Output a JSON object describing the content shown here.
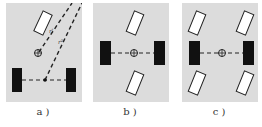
{
  "figure": {
    "panels": [
      {
        "id": "a",
        "caption": "a )",
        "description": "Front-wheel steering: two front wheels turned, instantaneous center on rear axle line",
        "labels": [
          "r'",
          "r²"
        ]
      },
      {
        "id": "b",
        "caption": "b )",
        "description": "Front and rear wheel steering, center wheels fixed, turning about center"
      },
      {
        "id": "c",
        "caption": "c )",
        "description": "Four-corner wheel steering with fixed middle wheels, turning about center"
      }
    ],
    "colors": {
      "panel_bg": "#dcdcdc",
      "fixed_wheel": "#111111",
      "steer_wheel": "#ffffff",
      "line": "#222222"
    }
  }
}
